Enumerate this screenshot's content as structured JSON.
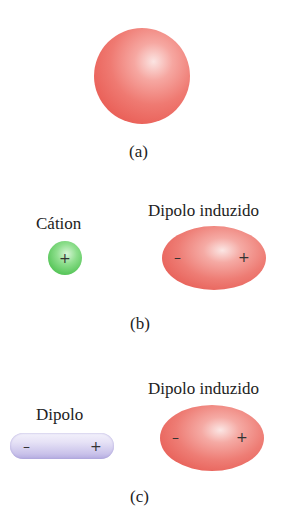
{
  "panels": {
    "a": {
      "caption": "(a)",
      "sphere": {
        "color": "#ec6a62"
      }
    },
    "b": {
      "caption": "(b)",
      "left_label": "Cátion",
      "cation_sign": "+",
      "right_label": "Dipolo induzido",
      "induced_minus": "–",
      "induced_plus": "+"
    },
    "c": {
      "caption": "(c)",
      "left_label": "Dipolo",
      "dipole_minus": "–",
      "dipole_plus": "+",
      "right_label": "Dipolo induzido",
      "induced_minus": "–",
      "induced_plus": "+"
    }
  },
  "colors": {
    "electron_cloud": "#ec6a62",
    "cation": "#5cc85e",
    "dipole": "#c9c2ea"
  }
}
